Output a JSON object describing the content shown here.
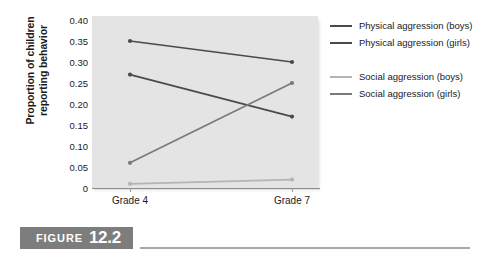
{
  "chart_data": {
    "type": "line",
    "title": "",
    "xlabel": "",
    "ylabel": "Proportion of children reporting behavior",
    "categories": [
      "Grade 4",
      "Grade 7"
    ],
    "ylim": [
      0,
      0.4
    ],
    "ytick_labels": [
      "0.40",
      "0.35",
      "0.30",
      "0.25",
      "0.20",
      "0.15",
      "0.10",
      "0.05",
      "0"
    ],
    "ytick_values": [
      0.4,
      0.35,
      0.3,
      0.25,
      0.2,
      0.15,
      0.1,
      0.05,
      0
    ],
    "grid": false,
    "legend_position": "right",
    "series": [
      {
        "name": "Physical aggression (boys)",
        "values": [
          0.35,
          0.3
        ],
        "color": "#4a4a4a"
      },
      {
        "name": "Physical aggression (girls)",
        "values": [
          0.27,
          0.17
        ],
        "color": "#4a4a4a"
      },
      {
        "name": "Social aggression (boys)",
        "values": [
          0.01,
          0.02
        ],
        "color": "#b4b4b4"
      },
      {
        "name": "Social aggression (girls)",
        "values": [
          0.06,
          0.25
        ],
        "color": "#7a7a7a"
      }
    ]
  },
  "axis": {
    "y_title_line1": "Proportion of children",
    "y_title_line2": "reporting behavior"
  },
  "legend": {
    "items": [
      {
        "label": "Physical aggression (boys)",
        "color": "#4a4a4a"
      },
      {
        "label": "Physical aggression (girls)",
        "color": "#4a4a4a"
      },
      {
        "label": "Social aggression (boys)",
        "color": "#b4b4b4"
      },
      {
        "label": "Social aggression (girls)",
        "color": "#7a7a7a"
      }
    ]
  },
  "caption": {
    "word": "FIGURE",
    "number": "12.2"
  },
  "colors": {
    "panel_background": "#e4e4e4",
    "axis": "#8d8d8d",
    "text": "#1a1a1a",
    "caption_box": "#7d7d7d",
    "caption_rule": "#a8a8a8"
  }
}
